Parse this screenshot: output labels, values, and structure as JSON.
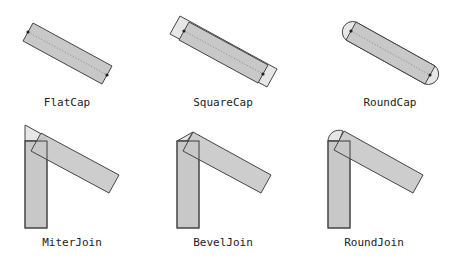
{
  "colors": {
    "background": "#ffffff",
    "body_fill": "#c8c8c8",
    "cap_fill": "#e6e6e6",
    "outline": "#444444",
    "centerline": "#888888"
  },
  "panels": [
    {
      "id": "flatcap",
      "label": "FlatCap",
      "kind": "cap"
    },
    {
      "id": "squarecap",
      "label": "SquareCap",
      "kind": "cap"
    },
    {
      "id": "roundcap",
      "label": "RoundCap",
      "kind": "cap"
    },
    {
      "id": "miterjoin",
      "label": "MiterJoin",
      "kind": "join"
    },
    {
      "id": "beveljoin",
      "label": "BevelJoin",
      "kind": "join"
    },
    {
      "id": "roundjoin",
      "label": "RoundJoin",
      "kind": "join"
    }
  ]
}
